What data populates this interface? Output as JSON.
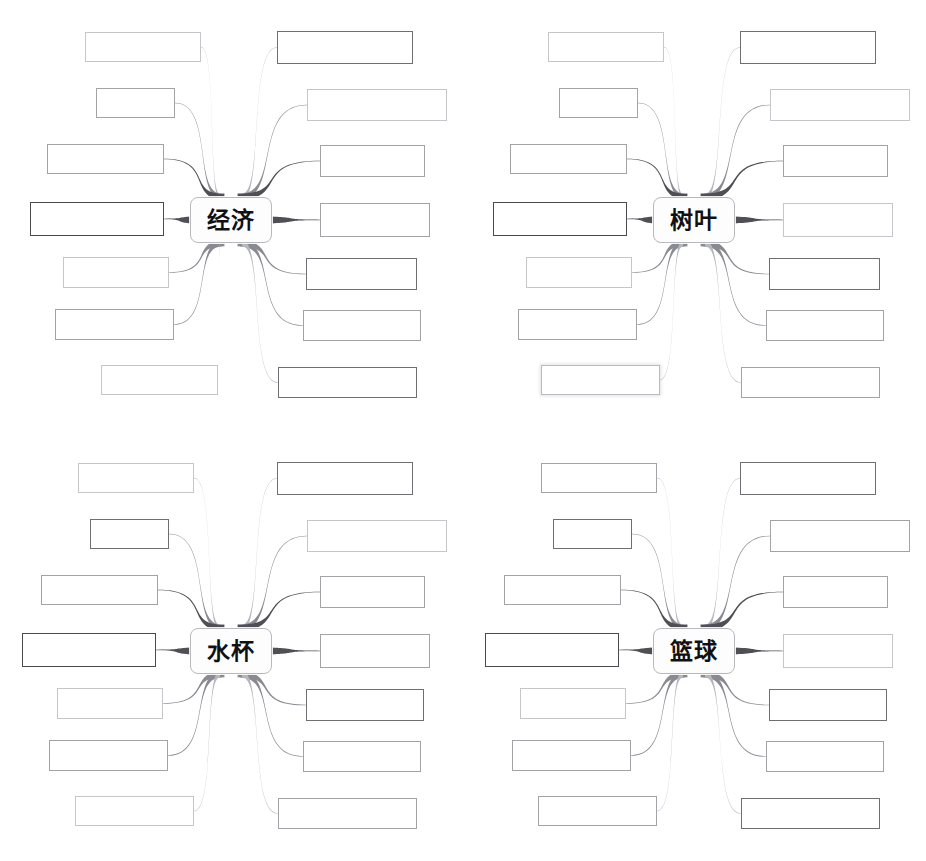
{
  "document": {
    "scan_header_text": "",
    "page_background": "#ffffff",
    "worksheet_type": "blank-mind-map-worksheet",
    "grid": "2x2"
  },
  "style_tokens": {
    "box_border_light": "#c6c6ca",
    "box_border_mid": "#a2a2a7",
    "box_border_dark": "#6e6e73",
    "box_border_bold": "#4a4a4e",
    "center_border": "#b9b9bd",
    "center_fill": "#fdfdfd",
    "connector_dark": "#4f4f55",
    "connector_mid": "#8a8a92",
    "connector_light": "#b6b6be",
    "text_color": "#111114"
  },
  "maps": [
    {
      "id": "map-economy",
      "position": "top-left",
      "center_label": "经济",
      "branch_count": 14,
      "left_branches": [
        {
          "index": 1,
          "label": "",
          "box": {
            "x": 85,
            "y": 32,
            "w": 116,
            "h": 30
          },
          "tone": "light"
        },
        {
          "index": 2,
          "label": "",
          "box": {
            "x": 96,
            "y": 88,
            "w": 79,
            "h": 30
          },
          "tone": "mid"
        },
        {
          "index": 3,
          "label": "",
          "box": {
            "x": 47,
            "y": 144,
            "w": 117,
            "h": 30
          },
          "tone": "mid"
        },
        {
          "index": 4,
          "label": "",
          "box": {
            "x": 30,
            "y": 202,
            "w": 134,
            "h": 34
          },
          "tone": "bold"
        },
        {
          "index": 5,
          "label": "",
          "box": {
            "x": 63,
            "y": 257,
            "w": 106,
            "h": 31
          },
          "tone": "light"
        },
        {
          "index": 6,
          "label": "",
          "box": {
            "x": 55,
            "y": 309,
            "w": 119,
            "h": 31
          },
          "tone": "mid"
        },
        {
          "index": 7,
          "label": "",
          "box": {
            "x": 101,
            "y": 365,
            "w": 117,
            "h": 30
          },
          "tone": "light"
        }
      ],
      "right_branches": [
        {
          "index": 1,
          "label": "",
          "box": {
            "x": 277,
            "y": 31,
            "w": 136,
            "h": 33
          },
          "tone": "dark"
        },
        {
          "index": 2,
          "label": "",
          "box": {
            "x": 307,
            "y": 89,
            "w": 140,
            "h": 32
          },
          "tone": "light"
        },
        {
          "index": 3,
          "label": "",
          "box": {
            "x": 320,
            "y": 145,
            "w": 105,
            "h": 32
          },
          "tone": "mid"
        },
        {
          "index": 4,
          "label": "",
          "box": {
            "x": 320,
            "y": 203,
            "w": 110,
            "h": 34
          },
          "tone": "mid"
        },
        {
          "index": 5,
          "label": "",
          "box": {
            "x": 306,
            "y": 258,
            "w": 111,
            "h": 32
          },
          "tone": "dark"
        },
        {
          "index": 6,
          "label": "",
          "box": {
            "x": 303,
            "y": 310,
            "w": 118,
            "h": 31
          },
          "tone": "mid"
        },
        {
          "index": 7,
          "label": "",
          "box": {
            "x": 278,
            "y": 367,
            "w": 139,
            "h": 31
          },
          "tone": "dark"
        }
      ]
    },
    {
      "id": "map-leaf",
      "position": "top-right",
      "center_label": "树叶",
      "branch_count": 14,
      "left_branches": [
        {
          "index": 1,
          "label": "",
          "box": {
            "x": 85,
            "y": 32,
            "w": 116,
            "h": 30
          },
          "tone": "light"
        },
        {
          "index": 2,
          "label": "",
          "box": {
            "x": 96,
            "y": 88,
            "w": 79,
            "h": 30
          },
          "tone": "mid"
        },
        {
          "index": 3,
          "label": "",
          "box": {
            "x": 47,
            "y": 144,
            "w": 117,
            "h": 30
          },
          "tone": "mid"
        },
        {
          "index": 4,
          "label": "",
          "box": {
            "x": 30,
            "y": 202,
            "w": 134,
            "h": 34
          },
          "tone": "bold"
        },
        {
          "index": 5,
          "label": "",
          "box": {
            "x": 63,
            "y": 257,
            "w": 106,
            "h": 31
          },
          "tone": "light"
        },
        {
          "index": 6,
          "label": "",
          "box": {
            "x": 55,
            "y": 309,
            "w": 119,
            "h": 31
          },
          "tone": "mid"
        },
        {
          "index": 7,
          "label": "",
          "box": {
            "x": 78,
            "y": 365,
            "w": 119,
            "h": 30
          },
          "tone": "glow"
        }
      ],
      "right_branches": [
        {
          "index": 1,
          "label": "",
          "box": {
            "x": 277,
            "y": 31,
            "w": 136,
            "h": 33
          },
          "tone": "dark"
        },
        {
          "index": 2,
          "label": "",
          "box": {
            "x": 307,
            "y": 89,
            "w": 140,
            "h": 32
          },
          "tone": "light"
        },
        {
          "index": 3,
          "label": "",
          "box": {
            "x": 320,
            "y": 145,
            "w": 105,
            "h": 32
          },
          "tone": "mid"
        },
        {
          "index": 4,
          "label": "",
          "box": {
            "x": 320,
            "y": 203,
            "w": 110,
            "h": 34
          },
          "tone": "light"
        },
        {
          "index": 5,
          "label": "",
          "box": {
            "x": 306,
            "y": 258,
            "w": 111,
            "h": 32
          },
          "tone": "dark"
        },
        {
          "index": 6,
          "label": "",
          "box": {
            "x": 303,
            "y": 310,
            "w": 118,
            "h": 31
          },
          "tone": "mid"
        },
        {
          "index": 7,
          "label": "",
          "box": {
            "x": 278,
            "y": 367,
            "w": 139,
            "h": 31
          },
          "tone": "mid"
        }
      ]
    },
    {
      "id": "map-watercup",
      "position": "bottom-left",
      "center_label": "水杯",
      "branch_count": 14,
      "left_branches": [
        {
          "index": 1,
          "label": "",
          "box": {
            "x": 78,
            "y": 32,
            "w": 116,
            "h": 30
          },
          "tone": "light"
        },
        {
          "index": 2,
          "label": "",
          "box": {
            "x": 90,
            "y": 88,
            "w": 79,
            "h": 30
          },
          "tone": "dark"
        },
        {
          "index": 3,
          "label": "",
          "box": {
            "x": 41,
            "y": 144,
            "w": 117,
            "h": 30
          },
          "tone": "mid"
        },
        {
          "index": 4,
          "label": "",
          "box": {
            "x": 22,
            "y": 202,
            "w": 134,
            "h": 34
          },
          "tone": "bold"
        },
        {
          "index": 5,
          "label": "",
          "box": {
            "x": 57,
            "y": 257,
            "w": 106,
            "h": 31
          },
          "tone": "light"
        },
        {
          "index": 6,
          "label": "",
          "box": {
            "x": 49,
            "y": 309,
            "w": 119,
            "h": 31
          },
          "tone": "mid"
        },
        {
          "index": 7,
          "label": "",
          "box": {
            "x": 75,
            "y": 365,
            "w": 119,
            "h": 30
          },
          "tone": "light"
        }
      ],
      "right_branches": [
        {
          "index": 1,
          "label": "",
          "box": {
            "x": 277,
            "y": 31,
            "w": 136,
            "h": 33
          },
          "tone": "dark"
        },
        {
          "index": 2,
          "label": "",
          "box": {
            "x": 307,
            "y": 89,
            "w": 140,
            "h": 32
          },
          "tone": "light"
        },
        {
          "index": 3,
          "label": "",
          "box": {
            "x": 320,
            "y": 145,
            "w": 105,
            "h": 32
          },
          "tone": "mid"
        },
        {
          "index": 4,
          "label": "",
          "box": {
            "x": 320,
            "y": 203,
            "w": 110,
            "h": 34
          },
          "tone": "mid"
        },
        {
          "index": 5,
          "label": "",
          "box": {
            "x": 306,
            "y": 258,
            "w": 118,
            "h": 32
          },
          "tone": "dark"
        },
        {
          "index": 6,
          "label": "",
          "box": {
            "x": 303,
            "y": 310,
            "w": 118,
            "h": 31
          },
          "tone": "mid"
        },
        {
          "index": 7,
          "label": "",
          "box": {
            "x": 278,
            "y": 367,
            "w": 139,
            "h": 31
          },
          "tone": "mid"
        }
      ]
    },
    {
      "id": "map-basketball",
      "position": "bottom-right",
      "center_label": "篮球",
      "branch_count": 14,
      "left_branches": [
        {
          "index": 1,
          "label": "",
          "box": {
            "x": 78,
            "y": 32,
            "w": 116,
            "h": 30
          },
          "tone": "mid"
        },
        {
          "index": 2,
          "label": "",
          "box": {
            "x": 90,
            "y": 88,
            "w": 79,
            "h": 30
          },
          "tone": "dark"
        },
        {
          "index": 3,
          "label": "",
          "box": {
            "x": 41,
            "y": 144,
            "w": 117,
            "h": 30
          },
          "tone": "mid"
        },
        {
          "index": 4,
          "label": "",
          "box": {
            "x": 22,
            "y": 202,
            "w": 134,
            "h": 34
          },
          "tone": "bold"
        },
        {
          "index": 5,
          "label": "",
          "box": {
            "x": 57,
            "y": 257,
            "w": 106,
            "h": 31
          },
          "tone": "light"
        },
        {
          "index": 6,
          "label": "",
          "box": {
            "x": 49,
            "y": 309,
            "w": 119,
            "h": 31
          },
          "tone": "mid"
        },
        {
          "index": 7,
          "label": "",
          "box": {
            "x": 75,
            "y": 365,
            "w": 119,
            "h": 30
          },
          "tone": "mid"
        }
      ],
      "right_branches": [
        {
          "index": 1,
          "label": "",
          "box": {
            "x": 277,
            "y": 31,
            "w": 136,
            "h": 33
          },
          "tone": "dark"
        },
        {
          "index": 2,
          "label": "",
          "box": {
            "x": 307,
            "y": 89,
            "w": 140,
            "h": 32
          },
          "tone": "mid"
        },
        {
          "index": 3,
          "label": "",
          "box": {
            "x": 320,
            "y": 145,
            "w": 105,
            "h": 32
          },
          "tone": "mid"
        },
        {
          "index": 4,
          "label": "",
          "box": {
            "x": 320,
            "y": 203,
            "w": 110,
            "h": 34
          },
          "tone": "light"
        },
        {
          "index": 5,
          "label": "",
          "box": {
            "x": 306,
            "y": 258,
            "w": 118,
            "h": 32
          },
          "tone": "dark"
        },
        {
          "index": 6,
          "label": "",
          "box": {
            "x": 303,
            "y": 310,
            "w": 118,
            "h": 31
          },
          "tone": "mid"
        },
        {
          "index": 7,
          "label": "",
          "box": {
            "x": 278,
            "y": 367,
            "w": 139,
            "h": 31
          },
          "tone": "dark"
        }
      ]
    }
  ]
}
